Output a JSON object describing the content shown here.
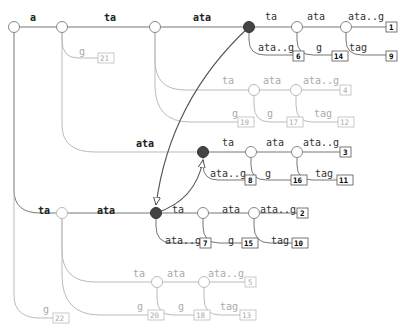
{
  "diagram": {
    "type": "suffix-tree",
    "edge_labels": {
      "root_a": "a",
      "a_ta": "ta",
      "a_g": "g",
      "ta_ata": "ata",
      "ata_ta": "ta",
      "ata_atag": "ata..g",
      "tata_ata": "ata",
      "tata_g": "g",
      "atata_atag": "ata..g",
      "atata_tag": "tag",
      "light1_ta": "ta",
      "light1_g": "g",
      "light1b_ata": "ata",
      "light1b_g": "g",
      "light1c_atag": "ata..g",
      "light1c_tag": "tag",
      "a_ata": "ata",
      "mid_ta": "ta",
      "mid_atag": "ata..g",
      "mid2_ata": "ata",
      "mid2_g": "g",
      "mid3_atag": "ata..g",
      "mid3_tag": "tag",
      "root_ta": "ta",
      "root_g": "g",
      "ta_ata2": "ata",
      "low_ta": "ta",
      "low_atag": "ata..g",
      "low2_ata": "ata",
      "low2_g": "g",
      "low3_atag": "ata..g",
      "low3_tag": "tag",
      "ta_g": "g",
      "light2_ta": "ta",
      "light2_ata": "ata",
      "light2_atag": "ata..g",
      "light2_g": "g",
      "light2_tag": "tag"
    },
    "leaves": {
      "l1": "1",
      "l2": "2",
      "l3": "3",
      "l4": "4",
      "l5": "5",
      "l6": "6",
      "l7": "7",
      "l8": "8",
      "l9": "9",
      "l10": "10",
      "l11": "11",
      "l12": "12",
      "l13": "13",
      "l14": "14",
      "l15": "15",
      "l16": "16",
      "l17": "17",
      "l18": "18",
      "l19": "19",
      "l20": "20",
      "l21": "21",
      "l22": "22"
    },
    "colors": {
      "edge": "#777777",
      "edge_light": "#bbbbbb",
      "filled_node": "#444444",
      "suffix_link": "#555555"
    }
  }
}
